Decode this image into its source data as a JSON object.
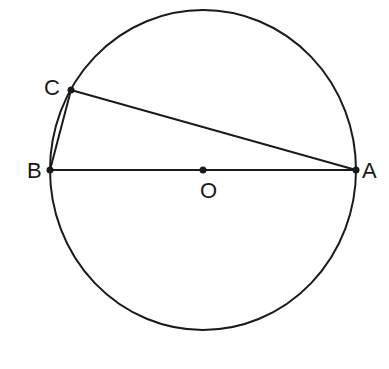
{
  "diagram": {
    "type": "geometry",
    "circle": {
      "center": "O",
      "cx": 203,
      "cy": 170,
      "rx": 153,
      "ry": 160
    },
    "points": {
      "A": {
        "label": "A",
        "x": 356,
        "y": 170
      },
      "B": {
        "label": "B",
        "x": 50,
        "y": 170
      },
      "C": {
        "label": "C",
        "x": 71,
        "y": 90
      },
      "O": {
        "label": "O",
        "x": 203,
        "y": 170
      }
    },
    "segments": [
      {
        "from": "B",
        "to": "A",
        "note": "diameter through O"
      },
      {
        "from": "C",
        "to": "A"
      },
      {
        "from": "B",
        "to": "C"
      }
    ],
    "colors": {
      "stroke": "#1a1a1a",
      "background": "#ffffff"
    }
  }
}
